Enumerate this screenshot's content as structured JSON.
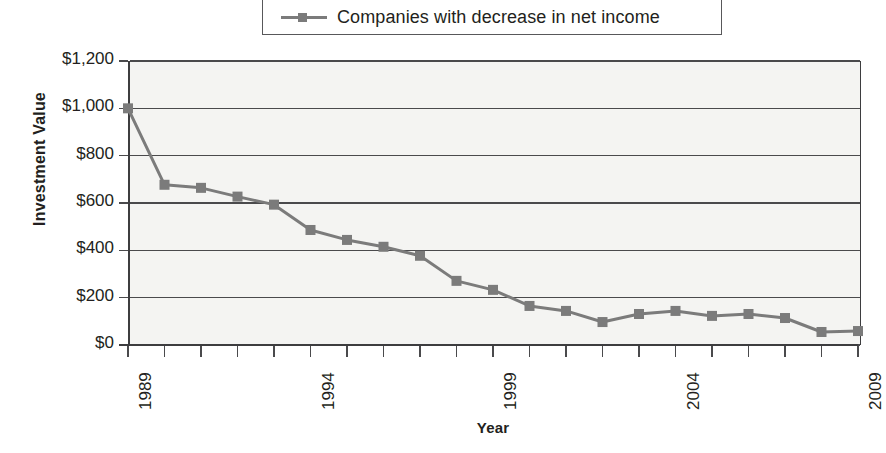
{
  "chart_data": {
    "type": "line",
    "title": "",
    "xlabel": "Year",
    "ylabel": "Investment Value",
    "legend_position": "top",
    "grid": true,
    "xlim": [
      1989,
      2009
    ],
    "ylim": [
      0,
      1200
    ],
    "ytick_labels": [
      "$1,200",
      "$1,000",
      "$800",
      "$600",
      "$400",
      "$200",
      "$0"
    ],
    "ytick_values": [
      1200,
      1000,
      800,
      600,
      400,
      200,
      0
    ],
    "xtick_labels": [
      "1989",
      "1994",
      "1999",
      "2004",
      "2009"
    ],
    "xtick_values": [
      1989,
      1994,
      1999,
      2004,
      2009
    ],
    "x": [
      1989,
      1990,
      1991,
      1992,
      1993,
      1994,
      1995,
      1996,
      1997,
      1998,
      1999,
      2000,
      2001,
      2002,
      2003,
      2004,
      2005,
      2006,
      2007,
      2008,
      2009
    ],
    "series": [
      {
        "name": "Companies with decrease in net income",
        "color": "#7b7b7b",
        "marker": "square",
        "values": [
          1000,
          677,
          664,
          627,
          593,
          486,
          444,
          415,
          377,
          271,
          233,
          165,
          144,
          97,
          131,
          144,
          123,
          131,
          114,
          55,
          59
        ]
      }
    ]
  },
  "legend": {
    "entries": [
      {
        "label": "Companies with decrease in net income",
        "marker": "legend-series-marker"
      }
    ]
  },
  "colors": {
    "series": "#7b7b7b",
    "axis": "#4a4a4c",
    "plot_background": "#f4f4f2",
    "text": "#231f20"
  }
}
